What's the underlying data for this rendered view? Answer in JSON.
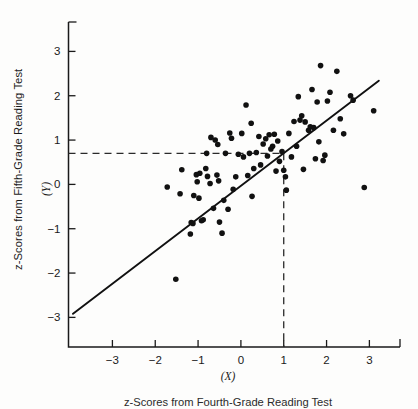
{
  "figure": {
    "background_color": "#fdfdfc",
    "ink_color": "#1a1a1a"
  },
  "axis_titles": {
    "y_title": "z-Scores from Fifth-Grade Reading Test",
    "y_variable": "(Y)",
    "x_variable": "(X)",
    "x_title": "z-Scores from Fourth-Grade Reading Test"
  },
  "chart_data": {
    "type": "scatter",
    "title": "",
    "xlabel": "z-Scores from Fourth-Grade Reading Test",
    "ylabel": "z-Scores from Fifth-Grade Reading Test",
    "xvar": "(X)",
    "yvar": "(Y)",
    "xlim": [
      -4.1,
      3.85
    ],
    "ylim": [
      -3.55,
      3.6
    ],
    "xticks": [
      -3,
      -2,
      -1,
      0,
      1,
      2,
      3
    ],
    "xticklabels": [
      "-3",
      "-2",
      "-1",
      "0",
      "1",
      "2",
      "3"
    ],
    "yticks": [
      -3,
      -2,
      -1,
      0,
      1,
      2,
      3
    ],
    "yticklabels": [
      "-3",
      "-2",
      "-1",
      "0",
      "1",
      "2",
      "3"
    ],
    "grid": false,
    "legend": null,
    "marker": {
      "shape": "circle",
      "size_px": 4.0,
      "color": "#111111"
    },
    "regression_line": {
      "label": "regression line of Y on X",
      "x_start": -3.92,
      "y_start": -2.92,
      "x_end": 3.22,
      "y_end": 2.34,
      "slope": 0.736,
      "intercept": -0.036,
      "color": "#111111",
      "width_px": 1.9
    },
    "guide_lines": [
      {
        "name": "vertical-guide",
        "orientation": "vertical",
        "x": 1.0,
        "y_from": -3.55,
        "y_to": 0.7,
        "style": "dashed"
      },
      {
        "name": "horizontal-guide",
        "orientation": "horizontal",
        "y": 0.7,
        "x_from": -4.1,
        "x_to": 1.0,
        "style": "dashed"
      }
    ],
    "points": [
      [
        -1.72,
        -0.06
      ],
      [
        -1.52,
        -2.14
      ],
      [
        -1.42,
        -0.21
      ],
      [
        -1.38,
        0.33
      ],
      [
        -1.18,
        -1.12
      ],
      [
        -1.16,
        -0.86
      ],
      [
        -1.12,
        -0.88
      ],
      [
        -1.1,
        -0.25
      ],
      [
        -1.04,
        0.22
      ],
      [
        -1.02,
        0.06
      ],
      [
        -0.98,
        -0.31
      ],
      [
        -0.96,
        0.25
      ],
      [
        -0.92,
        -0.82
      ],
      [
        -0.88,
        -0.8
      ],
      [
        -0.82,
        0.36
      ],
      [
        -0.8,
        0.7
      ],
      [
        -0.78,
        0.18
      ],
      [
        -0.72,
        0.02
      ],
      [
        -0.7,
        1.06
      ],
      [
        -0.64,
        -0.54
      ],
      [
        -0.6,
        1.0
      ],
      [
        -0.56,
        0.21
      ],
      [
        -0.54,
        0.9
      ],
      [
        -0.52,
        0.08
      ],
      [
        -0.5,
        -0.85
      ],
      [
        -0.44,
        -1.1
      ],
      [
        -0.4,
        -0.36
      ],
      [
        -0.36,
        0.7
      ],
      [
        -0.3,
        -0.56
      ],
      [
        -0.26,
        1.16
      ],
      [
        -0.22,
        1.04
      ],
      [
        -0.18,
        -0.11
      ],
      [
        -0.12,
        0.17
      ],
      [
        -0.06,
        0.68
      ],
      [
        0.02,
        1.15
      ],
      [
        0.06,
        0.62
      ],
      [
        0.12,
        1.79
      ],
      [
        0.16,
        0.2
      ],
      [
        0.2,
        0.7
      ],
      [
        0.24,
        1.38
      ],
      [
        0.26,
        -0.27
      ],
      [
        0.3,
        0.36
      ],
      [
        0.36,
        0.72
      ],
      [
        0.42,
        1.08
      ],
      [
        0.46,
        0.44
      ],
      [
        0.52,
        0.91
      ],
      [
        0.58,
        1.03
      ],
      [
        0.62,
        0.64
      ],
      [
        0.66,
        1.12
      ],
      [
        0.7,
        0.8
      ],
      [
        0.74,
        0.86
      ],
      [
        0.78,
        1.13
      ],
      [
        0.82,
        0.3
      ],
      [
        0.86,
        0.98
      ],
      [
        0.9,
        0.52
      ],
      [
        0.96,
        0.74
      ],
      [
        1.0,
        0.32
      ],
      [
        1.04,
        0.17
      ],
      [
        1.06,
        -0.13
      ],
      [
        1.12,
        1.15
      ],
      [
        1.18,
        0.62
      ],
      [
        1.24,
        1.42
      ],
      [
        1.3,
        0.86
      ],
      [
        1.34,
        1.98
      ],
      [
        1.38,
        1.45
      ],
      [
        1.42,
        1.55
      ],
      [
        1.46,
        0.34
      ],
      [
        1.5,
        1.41
      ],
      [
        1.58,
        1.22
      ],
      [
        1.62,
        1.3
      ],
      [
        1.66,
        2.14
      ],
      [
        1.7,
        1.28
      ],
      [
        1.74,
        0.58
      ],
      [
        1.78,
        1.86
      ],
      [
        1.82,
        0.96
      ],
      [
        1.86,
        2.68
      ],
      [
        1.92,
        0.54
      ],
      [
        1.96,
        0.66
      ],
      [
        2.02,
        1.88
      ],
      [
        2.08,
        2.08
      ],
      [
        2.16,
        1.22
      ],
      [
        2.24,
        2.55
      ],
      [
        2.32,
        1.48
      ],
      [
        2.4,
        1.14
      ],
      [
        2.56,
        2.0
      ],
      [
        2.62,
        1.9
      ],
      [
        2.88,
        -0.07
      ],
      [
        3.1,
        1.66
      ]
    ]
  }
}
